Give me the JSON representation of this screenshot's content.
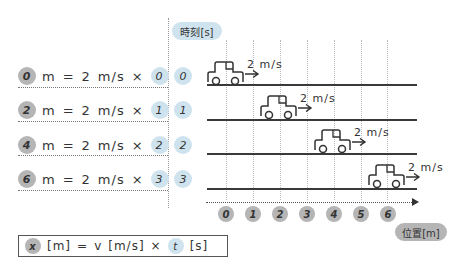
{
  "time_axis": {
    "label": "時刻[s]",
    "badge_color": "#cfe3ef"
  },
  "position_axis": {
    "label": "位置[m]",
    "badge_color": "#b5b5b5",
    "ticks": [
      "0",
      "1",
      "2",
      "3",
      "4",
      "5",
      "6"
    ]
  },
  "rows": [
    {
      "distance": "0",
      "unit_m": "m",
      "eq": "=",
      "speed": "2",
      "speed_unit": "m/s",
      "times": "×",
      "time": "0",
      "unit_s": "s",
      "time_label": "0",
      "car_speed_label": "2 m/s"
    },
    {
      "distance": "2",
      "unit_m": "m",
      "eq": "=",
      "speed": "2",
      "speed_unit": "m/s",
      "times": "×",
      "time": "1",
      "unit_s": "s",
      "time_label": "1",
      "car_speed_label": "2 m/s"
    },
    {
      "distance": "4",
      "unit_m": "m",
      "eq": "=",
      "speed": "2",
      "speed_unit": "m/s",
      "times": "×",
      "time": "2",
      "unit_s": "s",
      "time_label": "2",
      "car_speed_label": "2 m/s"
    },
    {
      "distance": "6",
      "unit_m": "m",
      "eq": "=",
      "speed": "2",
      "speed_unit": "m/s",
      "times": "×",
      "time": "3",
      "unit_s": "s",
      "time_label": "3",
      "car_speed_label": "2 m/s"
    }
  ],
  "formula": {
    "x": "x",
    "x_unit": "[m]",
    "eq": "=",
    "v": "v",
    "v_unit": "[m/s]",
    "times": "×",
    "t": "t",
    "t_unit": "[s]"
  },
  "colors": {
    "gray_disc": "#b5b5b5",
    "blue_disc": "#cfe3ef",
    "line": "#3a3a3a"
  }
}
